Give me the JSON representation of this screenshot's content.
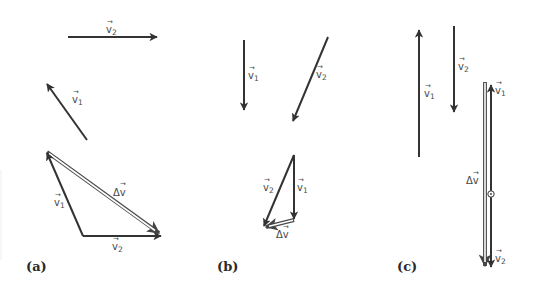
{
  "diagram": {
    "colors": {
      "vector": "#333333",
      "hollow_vector_outline": "#4a4a4a",
      "label_text": "#4a4a4a",
      "background": "#ffffff"
    },
    "panels": [
      {
        "id": "a",
        "label": "(a)",
        "separate_vectors": [
          {
            "name": "v2",
            "text": "v",
            "sub": "2",
            "from": [
              68,
              37
            ],
            "to": [
              157,
              37
            ]
          },
          {
            "name": "v1",
            "text": "v",
            "sub": "1",
            "from": [
              87,
              140
            ],
            "to": [
              47,
              83
            ]
          }
        ],
        "triangle": {
          "v1": {
            "text": "v",
            "sub": "1",
            "from": [
              83,
              236
            ],
            "to": [
              47,
              152
            ]
          },
          "v2": {
            "text": "v",
            "sub": "2",
            "from": [
              83,
              236
            ],
            "to": [
              162,
              236
            ]
          },
          "delta_v": {
            "text": "Δv",
            "from": [
              47,
              152
            ],
            "to": [
              162,
              235
            ]
          }
        }
      },
      {
        "id": "b",
        "label": "(b)",
        "separate_vectors": [
          {
            "name": "v1",
            "text": "v",
            "sub": "1",
            "from": [
              244,
              40
            ],
            "to": [
              244,
              110
            ]
          },
          {
            "name": "v2",
            "text": "v",
            "sub": "2",
            "from": [
              328,
              37
            ],
            "to": [
              292,
              122
            ]
          }
        ],
        "triangle": {
          "v1": {
            "text": "v",
            "sub": "1",
            "from": [
              294,
              155
            ],
            "to": [
              294,
              219
            ]
          },
          "v2": {
            "text": "v",
            "sub": "2",
            "from": [
              294,
              155
            ],
            "to": [
              263,
              227
            ]
          },
          "delta_v": {
            "text": "Δv",
            "from": [
              294,
              219
            ],
            "to": [
              263,
              227
            ]
          }
        }
      },
      {
        "id": "c",
        "label": "(c)",
        "separate_vectors": [
          {
            "name": "v1",
            "text": "v",
            "sub": "1",
            "from": [
              419,
              157
            ],
            "to": [
              419,
              30
            ]
          },
          {
            "name": "v2",
            "text": "v",
            "sub": "2",
            "from": [
              454,
              26
            ],
            "to": [
              454,
              112
            ]
          }
        ],
        "collinear": {
          "v1": {
            "text": "v",
            "sub": "1",
            "from": [
              491,
              194
            ],
            "to": [
              491,
              84
            ]
          },
          "v2": {
            "text": "v",
            "sub": "2",
            "from": [
              491,
              194
            ],
            "to": [
              491,
              268
            ]
          },
          "delta_v": {
            "text": "Δv",
            "from": [
              485,
              82
            ],
            "to": [
              485,
              268
            ]
          },
          "origin_marker": "circle-dot"
        }
      }
    ],
    "labels": {
      "v": "v",
      "sub1": "1",
      "sub2": "2",
      "delta_v": "Δv",
      "vec_arrow": "→",
      "panel_a": "(a)",
      "panel_b": "(b)",
      "panel_c": "(c)"
    }
  }
}
